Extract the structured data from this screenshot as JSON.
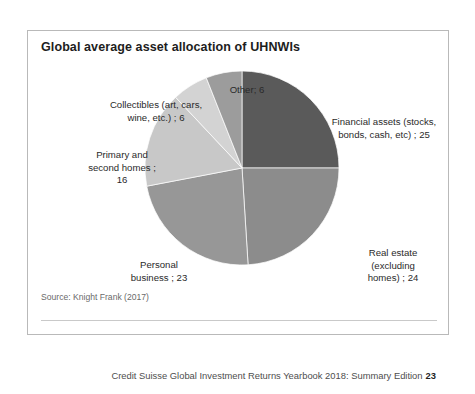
{
  "chart_title": "Global average asset allocation of UHNWIs",
  "source_note": "Source: Knight Frank (2017)",
  "footer": {
    "text": "Credit Suisse Global Investment Returns Yearbook 2018: Summary Edition",
    "page_number": "23"
  },
  "labels": {
    "other": "Other; 6",
    "financial": "Financial assets (stocks,\nbonds, cash, etc) ; 25",
    "real_estate": "Real estate\n(excluding\nhomes) ; 24",
    "personal_business": "Personal\nbusiness  ; 23",
    "primary_homes": "Primary and\nsecond homes ;\n16",
    "collectibles": "Collectibles (art, cars,\nwine, etc.) ; 6"
  },
  "chart_data": {
    "type": "pie",
    "title": "Global average asset allocation of UHNWIs",
    "subtitle": "",
    "xlabel": "",
    "ylabel": "",
    "units": "percent",
    "total": 100,
    "start_angle_deg": 0,
    "direction": "clockwise",
    "legend": "none (labels placed around slices)",
    "grid": false,
    "categories": [
      "Financial assets (stocks, bonds, cash, etc)",
      "Real estate (excluding homes)",
      "Personal business",
      "Primary and second homes",
      "Collectibles (art, cars, wine, etc.)",
      "Other"
    ],
    "values": [
      25,
      24,
      23,
      16,
      6,
      6
    ],
    "slices": [
      {
        "name": "Financial assets (stocks, bonds, cash, etc)",
        "value": 25,
        "color": "#5a5a5a"
      },
      {
        "name": "Real estate (excluding homes)",
        "value": 24,
        "color": "#8c8c8c"
      },
      {
        "name": "Personal business",
        "value": 23,
        "color": "#979797"
      },
      {
        "name": "Primary and second homes",
        "value": 16,
        "color": "#c8c8c8"
      },
      {
        "name": "Collectibles (art, cars, wine, etc.)",
        "value": 6,
        "color": "#d3d3d3"
      },
      {
        "name": "Other",
        "value": 6,
        "color": "#9c9c9c"
      }
    ]
  },
  "colors": {
    "panel_border": "#b9b9b9",
    "title_text": "#1d1d1d",
    "body_text": "#2a2a2a",
    "muted_text": "#6a6a6a",
    "rule": "#c9c9c9"
  }
}
